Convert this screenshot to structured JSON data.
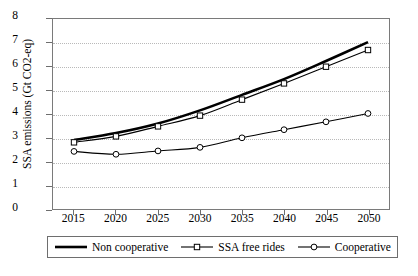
{
  "chart_data": {
    "type": "line",
    "title": "",
    "xlabel": "",
    "ylabel": "SSA emissions (Gt CO2-eq)",
    "categories": [
      "2015",
      "2020",
      "2025",
      "2030",
      "2035",
      "2040",
      "2045",
      "2050"
    ],
    "x": [
      2015,
      2020,
      2025,
      2030,
      2035,
      2040,
      2045,
      2050
    ],
    "xlim": [
      2012.5,
      2052.5
    ],
    "ylim": [
      0,
      8
    ],
    "yticks": [
      0,
      1,
      2,
      3,
      4,
      5,
      6,
      7,
      8
    ],
    "ytick_labels": [
      "0",
      "1",
      "2",
      "3",
      "4",
      "5",
      "6",
      "7",
      "8"
    ],
    "grid": true,
    "grid_axis": "y",
    "grid_style": "dotted",
    "legend_position": "below",
    "series": [
      {
        "name": "Non cooperative",
        "values": [
          2.93,
          3.22,
          3.62,
          4.17,
          4.82,
          5.48,
          6.24,
          7.03
        ],
        "marker": "none",
        "line_width": 2.6,
        "color": "#000000"
      },
      {
        "name": "SSA free rides",
        "values": [
          2.83,
          3.08,
          3.5,
          3.95,
          4.62,
          5.3,
          6.0,
          6.7
        ],
        "marker": "square",
        "line_width": 1.1,
        "color": "#000000"
      },
      {
        "name": "Cooperative",
        "values": [
          2.45,
          2.33,
          2.47,
          2.62,
          3.02,
          3.36,
          3.69,
          4.04
        ],
        "marker": "circle",
        "line_width": 1.1,
        "color": "#000000"
      }
    ]
  },
  "legend": {
    "items": [
      {
        "label": "Non cooperative",
        "marker": "none"
      },
      {
        "label": "SSA free rides",
        "marker": "square"
      },
      {
        "label": "Cooperative",
        "marker": "circle"
      }
    ]
  }
}
